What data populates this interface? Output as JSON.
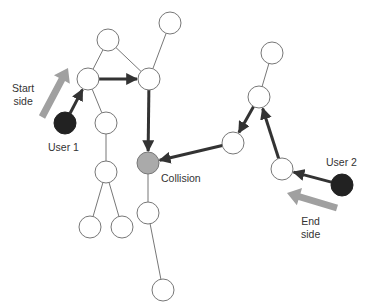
{
  "diagram": {
    "type": "graph-traversal",
    "labels": {
      "start_side": [
        "Start",
        "side"
      ],
      "end_side": [
        "End",
        "side"
      ],
      "user1": "User 1",
      "user2": "User 2",
      "collision": "Collision"
    },
    "colors": {
      "node_stroke": "#777777",
      "node_fill": "#ffffff",
      "collision_fill": "#aaaaaa",
      "user_fill": "#222222",
      "path_arrow": "#333333",
      "direction_arrow": "#a0a0a0",
      "edge": "#777777"
    },
    "nodes": [
      {
        "id": "n_top",
        "x": 108,
        "y": 40
      },
      {
        "id": "n_topright",
        "x": 170,
        "y": 23
      },
      {
        "id": "n_left",
        "x": 88,
        "y": 79
      },
      {
        "id": "n_right",
        "x": 149,
        "y": 79
      },
      {
        "id": "n_leftbelow",
        "x": 106,
        "y": 123
      },
      {
        "id": "n_leftmid",
        "x": 106,
        "y": 172
      },
      {
        "id": "n_bl1",
        "x": 90,
        "y": 227
      },
      {
        "id": "n_bl2",
        "x": 122,
        "y": 227
      },
      {
        "id": "n_collision",
        "x": 148,
        "y": 163,
        "kind": "collision"
      },
      {
        "id": "n_belowcoll",
        "x": 148,
        "y": 213
      },
      {
        "id": "n_bottom",
        "x": 163,
        "y": 290
      },
      {
        "id": "n_r_top",
        "x": 272,
        "y": 53
      },
      {
        "id": "n_r_mid",
        "x": 259,
        "y": 97
      },
      {
        "id": "n_r_low",
        "x": 233,
        "y": 143
      },
      {
        "id": "n_r_right",
        "x": 282,
        "y": 169
      },
      {
        "id": "user1",
        "x": 65,
        "y": 123,
        "kind": "user"
      },
      {
        "id": "user2",
        "x": 342,
        "y": 185,
        "kind": "user"
      }
    ],
    "edges": [
      [
        "n_top",
        "n_left"
      ],
      [
        "n_top",
        "n_right"
      ],
      [
        "n_topright",
        "n_right"
      ],
      [
        "n_left",
        "n_leftbelow"
      ],
      [
        "n_leftbelow",
        "n_leftmid"
      ],
      [
        "n_leftmid",
        "n_bl1"
      ],
      [
        "n_leftmid",
        "n_bl2"
      ],
      [
        "n_collision",
        "n_belowcoll"
      ],
      [
        "n_belowcoll",
        "n_bottom"
      ],
      [
        "n_r_top",
        "n_r_mid"
      ]
    ],
    "path_arrows": [
      [
        "user1",
        "n_left"
      ],
      [
        "n_left",
        "n_right"
      ],
      [
        "n_right",
        "n_collision"
      ],
      [
        "user2",
        "n_r_right"
      ],
      [
        "n_r_right",
        "n_r_mid"
      ],
      [
        "n_r_mid",
        "n_r_low"
      ],
      [
        "n_r_low",
        "n_collision"
      ]
    ],
    "direction_arrows": [
      {
        "name": "start-side",
        "from": [
          42,
          117
        ],
        "to": [
          68,
          68
        ]
      },
      {
        "name": "end-side",
        "from": [
          337,
          208
        ],
        "to": [
          287,
          193
        ]
      }
    ]
  }
}
